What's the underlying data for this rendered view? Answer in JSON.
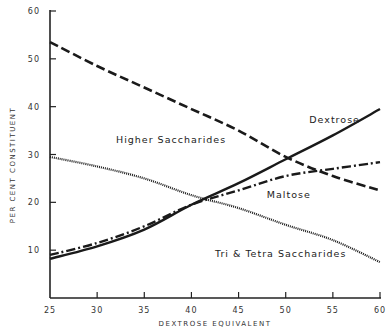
{
  "chart_data": {
    "type": "line",
    "title": "",
    "xlabel": "DEXTROSE EQUIVALENT",
    "ylabel": "PER CENT CONSTITUENT",
    "xlim": [
      25,
      60
    ],
    "ylim": [
      0,
      60
    ],
    "grid": false,
    "legend": "inline labels",
    "x_ticks": [
      25,
      30,
      35,
      40,
      45,
      50,
      55,
      60
    ],
    "y_ticks": [
      10,
      20,
      30,
      40,
      50,
      60
    ],
    "x": [
      25,
      30,
      35,
      40,
      45,
      50,
      55,
      60
    ],
    "series": [
      {
        "name": "Dextrose",
        "style": "solid",
        "values": [
          8.2,
          10.8,
          14.3,
          19.5,
          24.0,
          29.0,
          34.0,
          39.5
        ],
        "label_pos": [
          52.5,
          36.5
        ]
      },
      {
        "name": "Higher Saccharides",
        "style": "dashed",
        "values": [
          53.5,
          48.5,
          44.0,
          39.5,
          35.0,
          29.5,
          25.5,
          22.5
        ],
        "label_pos": [
          32.0,
          32.5
        ]
      },
      {
        "name": "Maltose",
        "style": "dash-dot",
        "values": [
          9.0,
          11.5,
          15.0,
          19.5,
          22.5,
          25.5,
          27.0,
          28.4
        ],
        "label_pos": [
          48.0,
          21.0
        ]
      },
      {
        "name": "Tri & Tetra Saccharides",
        "style": "dotted",
        "values": [
          29.5,
          27.5,
          25.0,
          21.5,
          18.8,
          15.3,
          12.1,
          7.5
        ],
        "label_pos": [
          42.5,
          8.5
        ]
      }
    ]
  }
}
